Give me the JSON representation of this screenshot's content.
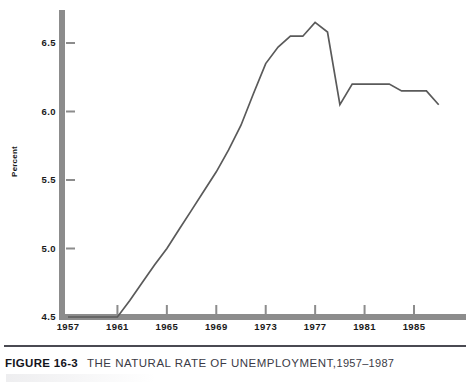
{
  "figure": {
    "number_label": "FIGURE 16-3",
    "title": "THE NATURAL RATE OF UNEMPLOYMENT,",
    "year_range": "1957–1987"
  },
  "axis": {
    "y_label": "Percent",
    "y_ticks": [
      "6.5",
      "6.0",
      "5.5",
      "5.0",
      "4.5"
    ],
    "x_ticks": [
      "1957",
      "1961",
      "1965",
      "1969",
      "1973",
      "1977",
      "1981",
      "1985"
    ]
  },
  "colors": {
    "axis_bar": "#8c8c8c",
    "line": "#5a5a5a",
    "caption_rule": "#4a4a52",
    "text": "#1a1a1a"
  },
  "chart_data": {
    "type": "line",
    "xlabel": "",
    "ylabel": "Percent",
    "xlim": [
      1957,
      1988
    ],
    "ylim": [
      4.5,
      6.8
    ],
    "yticks": [
      4.5,
      5.0,
      5.5,
      6.0,
      6.5
    ],
    "xticks": [
      1957,
      1961,
      1965,
      1969,
      1973,
      1977,
      1981,
      1985
    ],
    "grid": false,
    "legend": false,
    "series": [
      {
        "name": "Natural rate of unemployment",
        "x": [
          1957,
          1958,
          1959,
          1960,
          1961,
          1962,
          1963,
          1964,
          1965,
          1966,
          1967,
          1968,
          1969,
          1970,
          1971,
          1972,
          1973,
          1974,
          1975,
          1976,
          1977,
          1978,
          1979,
          1980,
          1981,
          1982,
          1983,
          1984,
          1985,
          1986,
          1987
        ],
        "y": [
          4.5,
          4.5,
          4.5,
          4.5,
          4.5,
          4.62,
          4.75,
          4.88,
          5.0,
          5.14,
          5.28,
          5.42,
          5.56,
          5.72,
          5.9,
          6.13,
          6.35,
          6.47,
          6.55,
          6.55,
          6.65,
          6.58,
          6.05,
          6.2,
          6.2,
          6.2,
          6.2,
          6.15,
          6.15,
          6.15,
          6.05
        ]
      }
    ]
  }
}
